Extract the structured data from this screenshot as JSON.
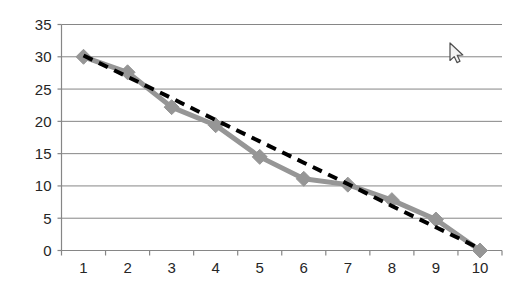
{
  "chart_data": {
    "type": "line",
    "title": "",
    "subtitle": "",
    "xlabel": "",
    "ylabel": "",
    "categories": [
      "1",
      "2",
      "3",
      "4",
      "5",
      "6",
      "7",
      "8",
      "9",
      "10"
    ],
    "x": [
      1,
      2,
      3,
      4,
      5,
      6,
      7,
      8,
      9,
      10
    ],
    "series": [
      {
        "name": "Series 1",
        "style": "solid",
        "color": "#969696",
        "marker": "diamond",
        "values": [
          30,
          27.6,
          22.2,
          19.4,
          14.5,
          11.1,
          10.2,
          7.8,
          4.8,
          0
        ]
      },
      {
        "name": "Linear trendline",
        "style": "dashed",
        "color": "#000000",
        "marker": "none",
        "values": [
          30.2,
          26.9,
          23.6,
          20.2,
          16.9,
          13.6,
          10.3,
          6.9,
          3.6,
          0.3
        ]
      }
    ],
    "ylim": [
      0,
      35
    ],
    "yticks": [
      0,
      5,
      10,
      15,
      20,
      25,
      30,
      35
    ],
    "ytick_labels": [
      "0",
      "5",
      "10",
      "15",
      "20",
      "25",
      "30",
      "35"
    ],
    "xtick_labels": [
      "1",
      "2",
      "3",
      "4",
      "5",
      "6",
      "7",
      "8",
      "9",
      "10"
    ],
    "grid": {
      "horizontal": true,
      "vertical": false,
      "color": "#868686"
    },
    "legend": {
      "visible": false,
      "position": "none"
    },
    "axis": {
      "color": "#868686",
      "y_axis_visible": true,
      "x_axis_visible": true
    },
    "plot_background": "#ffffff"
  },
  "cursor": {
    "name": "mouse-pointer",
    "x": 450,
    "y": 43,
    "visible": true
  }
}
